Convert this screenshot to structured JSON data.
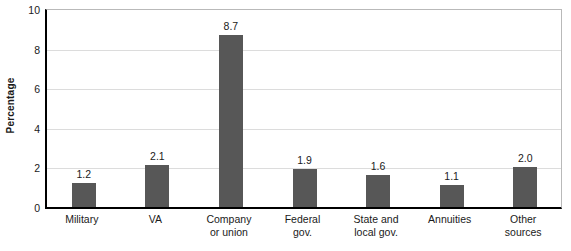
{
  "chart_data": {
    "type": "bar",
    "title": "",
    "xlabel": "",
    "ylabel": "Percentage",
    "ylim": [
      0,
      10
    ],
    "yticks": [
      0,
      2,
      4,
      6,
      8,
      10
    ],
    "ytick_labels": [
      "0",
      "2",
      "4",
      "6",
      "8",
      "10"
    ],
    "grid": true,
    "legend": "none",
    "bar_color": "#575757",
    "categories": [
      "Military",
      "VA",
      "Company or union",
      "Federal gov.",
      "State and local gov.",
      "Annuities",
      "Other sources"
    ],
    "category_lines": [
      [
        "Military"
      ],
      [
        "VA"
      ],
      [
        "Company",
        "or union"
      ],
      [
        "Federal",
        "gov."
      ],
      [
        "State and",
        "local gov."
      ],
      [
        "Annuities"
      ],
      [
        "Other",
        "sources"
      ]
    ],
    "values": [
      1.2,
      2.1,
      8.7,
      1.9,
      1.6,
      1.1,
      2.0
    ],
    "value_labels": [
      "1.2",
      "2.1",
      "8.7",
      "1.9",
      "1.6",
      "1.1",
      "2.0"
    ]
  }
}
